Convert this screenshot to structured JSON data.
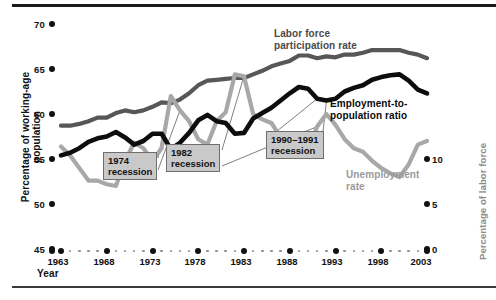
{
  "chart_data": {
    "type": "line",
    "title": "",
    "xlabel": "Year",
    "ylabel": "Percentage of working-age population",
    "ylabel_right": "Percentage of labor force",
    "xlim": [
      1963,
      2003
    ],
    "ylim": [
      45,
      70
    ],
    "ylim_right": [
      0,
      12.5
    ],
    "yticks": [
      45,
      50,
      55,
      60,
      65,
      70
    ],
    "yticks_right": [
      0,
      5,
      10
    ],
    "xticks": [
      1963,
      1968,
      1973,
      1978,
      1983,
      1988,
      1993,
      1998,
      2003
    ],
    "grid": false,
    "legend": "inline-labels",
    "x": [
      1963,
      1964,
      1965,
      1966,
      1967,
      1968,
      1969,
      1970,
      1971,
      1972,
      1973,
      1974,
      1975,
      1976,
      1977,
      1978,
      1979,
      1980,
      1981,
      1982,
      1983,
      1984,
      1985,
      1986,
      1987,
      1988,
      1989,
      1990,
      1991,
      1992,
      1993,
      1994,
      1995,
      1996,
      1997,
      1998,
      1999,
      2000,
      2001,
      2002,
      2003
    ],
    "series": [
      {
        "name": "Labor force participation rate",
        "color": "#575757",
        "axis": "left",
        "values": [
          58.7,
          58.7,
          58.9,
          59.2,
          59.6,
          59.6,
          60.1,
          60.4,
          60.2,
          60.4,
          60.8,
          61.3,
          61.2,
          61.6,
          62.3,
          63.2,
          63.7,
          63.8,
          63.9,
          64.0,
          64.0,
          64.4,
          64.8,
          65.3,
          65.6,
          65.9,
          66.5,
          66.5,
          66.2,
          66.4,
          66.3,
          66.6,
          66.6,
          66.8,
          67.1,
          67.1,
          67.1,
          67.1,
          66.8,
          66.6,
          66.2
        ]
      },
      {
        "name": "Employment-to-population ratio",
        "color": "#0d0d0d",
        "axis": "left",
        "values": [
          55.4,
          55.7,
          56.2,
          56.9,
          57.3,
          57.5,
          58.0,
          57.4,
          56.6,
          57.0,
          57.8,
          57.8,
          56.1,
          56.8,
          57.9,
          59.3,
          59.9,
          59.2,
          59.0,
          57.8,
          57.9,
          59.5,
          60.1,
          60.7,
          61.5,
          62.3,
          63.0,
          62.8,
          61.7,
          61.5,
          61.7,
          62.5,
          62.9,
          63.2,
          63.8,
          64.1,
          64.3,
          64.4,
          63.7,
          62.7,
          62.3
        ]
      },
      {
        "name": "Unemployment rate",
        "color": "#a8a8a8",
        "axis": "right",
        "values": [
          5.7,
          5.2,
          4.5,
          3.8,
          3.8,
          3.6,
          3.5,
          4.9,
          5.9,
          5.6,
          4.9,
          5.6,
          8.5,
          7.7,
          7.1,
          6.1,
          5.8,
          7.1,
          7.6,
          9.7,
          9.6,
          7.5,
          7.2,
          7.0,
          6.2,
          5.5,
          5.3,
          5.6,
          6.8,
          7.5,
          6.9,
          6.1,
          5.6,
          5.4,
          4.9,
          4.5,
          4.2,
          4.0,
          4.7,
          5.8,
          6.0
        ]
      }
    ],
    "annotations": [
      {
        "id": "rec1974",
        "year": "1974",
        "label": "recession"
      },
      {
        "id": "rec1982",
        "year": "1982",
        "label": "recession"
      },
      {
        "id": "rec1990",
        "year": "1990–1991",
        "label": "recession"
      }
    ]
  },
  "axis": {
    "left_ticks": [
      "70",
      "65",
      "60",
      "55",
      "50",
      "45"
    ],
    "right_ticks": [
      "10",
      "5",
      "0"
    ],
    "x_ticks": [
      "1963",
      "1968",
      "1973",
      "1978",
      "1983",
      "1988",
      "1993",
      "1998",
      "2003"
    ],
    "x_title": "Year",
    "y_title": "Percentage of working-age population",
    "y_title_right": "Percentage of labor force"
  },
  "series_labels": {
    "lfp_line1": "Labor force",
    "lfp_line2": "participation rate",
    "epr_line1": "Employment-to-",
    "epr_line2": "population ratio",
    "ur_line1": "Unemployment",
    "ur_line2": "rate"
  },
  "callouts": {
    "c1_year": "1974",
    "c1_word": "recession",
    "c2_year": "1982",
    "c2_word": "recession",
    "c3_year": "1990–1991",
    "c3_word": "recession"
  },
  "colors": {
    "lfp": "#575757",
    "epr": "#0d0d0d",
    "unemployment": "#a8a8a8",
    "callout_fill": "#c9c9c9",
    "axis_text": "#111111"
  }
}
